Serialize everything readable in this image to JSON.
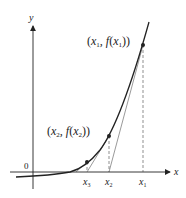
{
  "diagram": {
    "axes": {
      "x_label": "x",
      "y_label": "y",
      "origin_label": "0"
    },
    "points": [
      {
        "label": "(x1, f(x1))",
        "tick": "x1"
      },
      {
        "label": "(x2, f(x2))",
        "tick": "x2"
      },
      {
        "label": "",
        "tick": "x3"
      }
    ],
    "labels": {
      "p1_open": "(",
      "p1_x": "x",
      "p1_sub": "1",
      "p1_mid": ", f",
      "p1_open2": "(",
      "p1_x2": "x",
      "p1_sub2": "1",
      "p1_close": "))",
      "p2_open": "(",
      "p2_x": "x",
      "p2_sub": "2",
      "p2_mid": ", f",
      "p2_open2": "(",
      "p2_x2": "x",
      "p2_sub2": "2",
      "p2_close": "))",
      "tick1": "x",
      "tick1_sub": "1",
      "tick2": "x",
      "tick2_sub": "2",
      "tick3": "x",
      "tick3_sub": "3"
    },
    "colors": {
      "stroke": "#222222",
      "tangent": "#555555"
    }
  }
}
